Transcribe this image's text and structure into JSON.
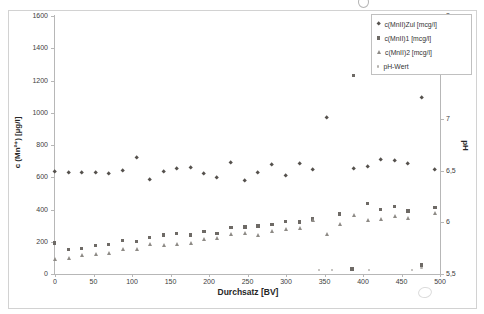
{
  "chart_data": {
    "type": "scatter",
    "title": "",
    "xlabel": "Durchsatz [BV]",
    "ylabel_left": "c (Mn²⁺) [µg/l]",
    "ylabel_right": "pH",
    "xlim": [
      0,
      500
    ],
    "ylim_left": [
      0,
      1600
    ],
    "ylim_right": [
      5.5,
      8
    ],
    "grid": "off",
    "x_ticks": {
      "labels": [
        "0",
        "50",
        "100",
        "150",
        "200",
        "250",
        "300",
        "350",
        "400",
        "450",
        "500"
      ],
      "values": [
        0,
        50,
        100,
        150,
        200,
        250,
        300,
        350,
        400,
        450,
        500
      ]
    },
    "y_left_ticks": {
      "labels": [
        "0",
        "200",
        "400",
        "600",
        "800",
        "1000",
        "1200",
        "1400",
        "1600"
      ],
      "values": [
        0,
        200,
        400,
        600,
        800,
        1000,
        1200,
        1400,
        1600
      ]
    },
    "y_right_ticks": {
      "labels": [
        "5,5",
        "6",
        "6,5",
        "7",
        "7,5",
        "8"
      ],
      "values": [
        5.5,
        6,
        6.5,
        7,
        7.5,
        8
      ]
    },
    "legend": {
      "position": "top-right"
    },
    "series": [
      {
        "name": "c(MnII)Zul [mcg/l]",
        "marker": "diamond",
        "color": "#55514d",
        "axis": "left",
        "points": [
          [
            0,
            635
          ],
          [
            18,
            625
          ],
          [
            35,
            625
          ],
          [
            53,
            625
          ],
          [
            70,
            620
          ],
          [
            88,
            640
          ],
          [
            106,
            720
          ],
          [
            123,
            580
          ],
          [
            141,
            635
          ],
          [
            158,
            650
          ],
          [
            176,
            655
          ],
          [
            194,
            620
          ],
          [
            211,
            595
          ],
          [
            229,
            690
          ],
          [
            247,
            575
          ],
          [
            264,
            625
          ],
          [
            282,
            675
          ],
          [
            300,
            610
          ],
          [
            318,
            680
          ],
          [
            335,
            645
          ],
          [
            353,
            970
          ],
          [
            388,
            650
          ],
          [
            406,
            665
          ],
          [
            423,
            705
          ],
          [
            441,
            700
          ],
          [
            459,
            680
          ],
          [
            476,
            1090
          ],
          [
            494,
            645
          ]
        ]
      },
      {
        "name": "c(MnII)1 [mcg/l]",
        "marker": "square",
        "color": "#6e6a66",
        "axis": "left",
        "points": [
          [
            0,
            190
          ],
          [
            18,
            150
          ],
          [
            35,
            155
          ],
          [
            53,
            175
          ],
          [
            70,
            180
          ],
          [
            88,
            205
          ],
          [
            106,
            200
          ],
          [
            123,
            225
          ],
          [
            141,
            240
          ],
          [
            158,
            250
          ],
          [
            176,
            240
          ],
          [
            194,
            260
          ],
          [
            211,
            250
          ],
          [
            229,
            285
          ],
          [
            247,
            290
          ],
          [
            264,
            295
          ],
          [
            282,
            305
          ],
          [
            300,
            325
          ],
          [
            318,
            320
          ],
          [
            335,
            340
          ],
          [
            370,
            370
          ],
          [
            386,
            30
          ],
          [
            388,
            1230
          ],
          [
            406,
            435
          ],
          [
            423,
            400
          ],
          [
            441,
            415
          ],
          [
            459,
            390
          ],
          [
            476,
            55
          ],
          [
            494,
            410
          ]
        ]
      },
      {
        "name": "c(MnII)2 [mcg/l]",
        "marker": "triangle",
        "color": "#8e8b86",
        "axis": "left",
        "points": [
          [
            0,
            90
          ],
          [
            18,
            95
          ],
          [
            35,
            115
          ],
          [
            53,
            120
          ],
          [
            70,
            125
          ],
          [
            88,
            150
          ],
          [
            106,
            150
          ],
          [
            123,
            180
          ],
          [
            141,
            175
          ],
          [
            158,
            180
          ],
          [
            176,
            190
          ],
          [
            194,
            215
          ],
          [
            211,
            220
          ],
          [
            229,
            245
          ],
          [
            247,
            250
          ],
          [
            264,
            240
          ],
          [
            282,
            265
          ],
          [
            300,
            275
          ],
          [
            318,
            285
          ],
          [
            335,
            330
          ],
          [
            353,
            245
          ],
          [
            370,
            310
          ],
          [
            388,
            360
          ],
          [
            406,
            330
          ],
          [
            423,
            340
          ],
          [
            441,
            355
          ],
          [
            459,
            345
          ],
          [
            494,
            375
          ]
        ]
      },
      {
        "name": "pH-Wert",
        "marker": "dot",
        "color": "#b4b2ae",
        "axis": "right",
        "points": [
          [
            344,
            5.53
          ],
          [
            361,
            5.53
          ],
          [
            409,
            5.53
          ],
          [
            465,
            5.53
          ],
          [
            477,
            5.55
          ]
        ]
      }
    ]
  }
}
